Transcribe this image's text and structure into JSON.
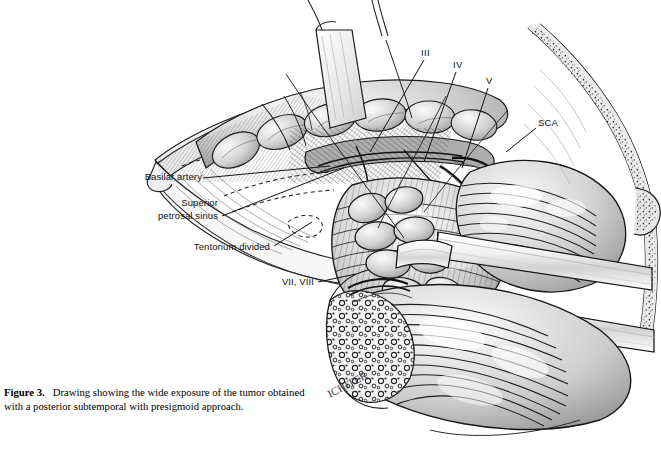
{
  "figure": {
    "number_label": "Figure 3.",
    "caption_text": "Drawing showing the wide exposure of the tumor obtained with a posterior subtemporal with presigmoid approach.",
    "medium": "pen-and-ink grayscale surgical illustration",
    "artist_signature": "ICHITER"
  },
  "labels": {
    "basilar_artery": "Basilar artery",
    "superior_petrosal_sinus_line1": "Superior",
    "superior_petrosal_sinus_line2": "petrosal sinus",
    "tentorium_divided": "Tentorium divided",
    "cranial_nerve_3": "III",
    "cranial_nerve_4": "IV",
    "cranial_nerve_5": "V",
    "superior_cerebellar_artery": "SCA",
    "cranial_nerve_7_8": "VII, VIII"
  },
  "colors": {
    "page_background": "#ffffff",
    "ink": "#1a1a1a",
    "label_text": "#111111",
    "mid_gray": "#8d8d8d",
    "light_gray": "#d7d7d7",
    "pale_gray": "#ececec",
    "shadow_gray": "#5c5c5c",
    "caption_text": "#000000"
  }
}
